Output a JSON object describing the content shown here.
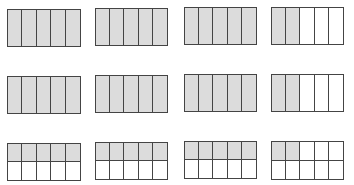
{
  "colors": {
    "shaded": "#dcdcdc",
    "unshaded": "#ffffff",
    "border": "#444444"
  },
  "figures": [
    {
      "id": "r1c1",
      "x": 7,
      "y": 9,
      "w": 74,
      "h": 38,
      "rows": 1,
      "cols": 5,
      "shaded": 5
    },
    {
      "id": "r1c2",
      "x": 95,
      "y": 8,
      "w": 73,
      "h": 38,
      "rows": 1,
      "cols": 5,
      "shaded": 5
    },
    {
      "id": "r1c3",
      "x": 184,
      "y": 7,
      "w": 73,
      "h": 38,
      "rows": 1,
      "cols": 5,
      "shaded": 5
    },
    {
      "id": "r1c4",
      "x": 271,
      "y": 7,
      "w": 73,
      "h": 38,
      "rows": 1,
      "cols": 5,
      "shaded": 2
    },
    {
      "id": "r2c1",
      "x": 7,
      "y": 76,
      "w": 74,
      "h": 38,
      "rows": 1,
      "cols": 5,
      "shaded": 5
    },
    {
      "id": "r2c2",
      "x": 95,
      "y": 75,
      "w": 73,
      "h": 38,
      "rows": 1,
      "cols": 5,
      "shaded": 5
    },
    {
      "id": "r2c3",
      "x": 184,
      "y": 74,
      "w": 73,
      "h": 38,
      "rows": 1,
      "cols": 5,
      "shaded": 5
    },
    {
      "id": "r2c4",
      "x": 271,
      "y": 74,
      "w": 73,
      "h": 38,
      "rows": 1,
      "cols": 5,
      "shaded": 2
    },
    {
      "id": "r3c1",
      "x": 7,
      "y": 143,
      "w": 74,
      "h": 38,
      "rows": 2,
      "cols": 5,
      "shaded": 5
    },
    {
      "id": "r3c2",
      "x": 95,
      "y": 142,
      "w": 73,
      "h": 38,
      "rows": 2,
      "cols": 5,
      "shaded": 5
    },
    {
      "id": "r3c3",
      "x": 184,
      "y": 141,
      "w": 73,
      "h": 38,
      "rows": 2,
      "cols": 5,
      "shaded": 5
    },
    {
      "id": "r3c4",
      "x": 271,
      "y": 141,
      "w": 73,
      "h": 39,
      "rows": 2,
      "cols": 5,
      "shaded": 2
    }
  ]
}
